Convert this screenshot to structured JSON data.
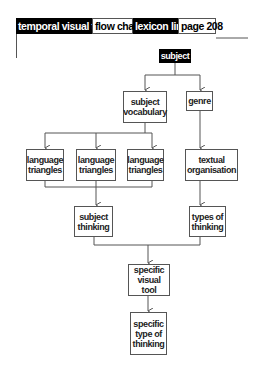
{
  "header": {
    "tabs": [
      {
        "label": "temporal visual tool",
        "style": "dark"
      },
      {
        "label": "flow chart",
        "style": "light"
      },
      {
        "label": "lexicon link",
        "style": "dark"
      },
      {
        "label": "page 208",
        "style": "light"
      }
    ]
  },
  "diagram": {
    "type": "flow chart",
    "nodes": {
      "subject": "subject",
      "subject_vocabulary": "subject vocabulary",
      "genre": "genre",
      "language_triangles_1": "language triangles",
      "language_triangles_2": "language triangles",
      "language_triangles_3": "language triangles",
      "textual_organisation": "textual organisation",
      "subject_thinking": "subject thinking",
      "types_of_thinking": "types of thinking",
      "specific_visual_tool": "specific visual tool",
      "specific_type_of_thinking": "specific type of thinking"
    },
    "edges": [
      [
        "subject",
        "subject_vocabulary"
      ],
      [
        "subject",
        "genre"
      ],
      [
        "subject_vocabulary",
        "language_triangles_1"
      ],
      [
        "subject_vocabulary",
        "language_triangles_2"
      ],
      [
        "subject_vocabulary",
        "language_triangles_3"
      ],
      [
        "genre",
        "textual_organisation"
      ],
      [
        "language_triangles_1",
        "subject_thinking"
      ],
      [
        "language_triangles_2",
        "subject_thinking"
      ],
      [
        "language_triangles_3",
        "subject_thinking"
      ],
      [
        "textual_organisation",
        "types_of_thinking"
      ],
      [
        "subject_thinking",
        "specific_visual_tool"
      ],
      [
        "types_of_thinking",
        "specific_visual_tool"
      ],
      [
        "specific_visual_tool",
        "specific_type_of_thinking"
      ]
    ],
    "colors": {
      "dark": "#000000",
      "line": "#555555"
    }
  }
}
